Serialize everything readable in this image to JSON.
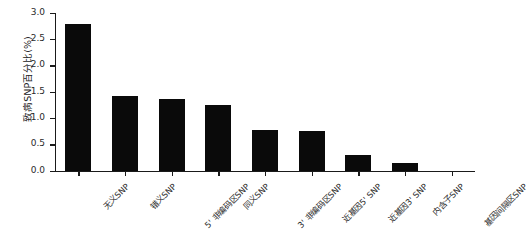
{
  "chart_data": {
    "type": "bar",
    "title": "",
    "xlabel": "",
    "ylabel": "致病SNP百分比(%)",
    "ylim": [
      0.0,
      3.0
    ],
    "grid": false,
    "legend": "none",
    "bar_color": "#0a0a0a",
    "y_ticks": [
      "0.0",
      "0.5",
      "1.0",
      "1.5",
      "2.0",
      "2.5",
      "3.0"
    ],
    "y_tick_values": [
      0.0,
      0.5,
      1.0,
      1.5,
      2.0,
      2.5,
      3.0
    ],
    "categories": [
      "无义SNP",
      "错义SNP",
      "5' 非编码区SNP",
      "同义SNP",
      "3' 非编码区SNP",
      "近基因5' SNP",
      "近基因3' SNP",
      "内含子SNP",
      "基因间隔区SNP"
    ],
    "values": [
      2.78,
      1.42,
      1.36,
      1.25,
      0.78,
      0.76,
      0.3,
      0.15,
      0.0
    ]
  }
}
